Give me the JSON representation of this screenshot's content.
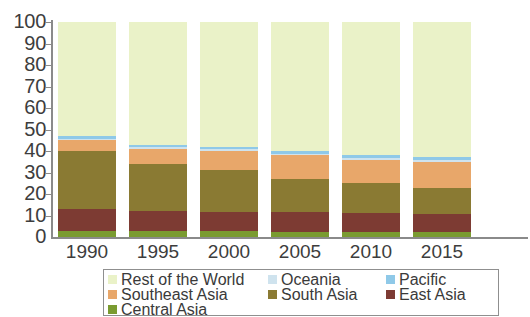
{
  "chart_data": {
    "type": "bar",
    "title": "",
    "subtitle": "",
    "xlabel": "",
    "ylabel": "",
    "stacked": true,
    "stack_total": 100,
    "grid": false,
    "legend_position": "bottom",
    "ylim": [
      0,
      100
    ],
    "ytick_labels": [
      "100",
      "90",
      "80",
      "70",
      "60",
      "50",
      "40",
      "30",
      "20",
      "10",
      "0"
    ],
    "ytick_values": [
      100,
      90,
      80,
      70,
      60,
      50,
      40,
      30,
      20,
      10,
      0
    ],
    "categories": [
      "1990",
      "1995",
      "2000",
      "2005",
      "2010",
      "2015"
    ],
    "series": [
      {
        "name": "Central Asia",
        "color": "#7a9b30",
        "values": [
          3.0,
          2.8,
          2.6,
          2.5,
          2.3,
          2.2
        ]
      },
      {
        "name": "East Asia",
        "color": "#7d3b33",
        "values": [
          10.0,
          9.4,
          9.2,
          9.3,
          8.8,
          8.6
        ]
      },
      {
        "name": "South Asia",
        "color": "#8a7a33",
        "values": [
          27.0,
          21.8,
          19.2,
          15.2,
          13.9,
          12.2
        ]
      },
      {
        "name": "Southeast Asia",
        "color": "#e8a76a",
        "values": [
          5.0,
          7.0,
          9.0,
          11.0,
          11.0,
          12.0
        ]
      },
      {
        "name": "Oceania",
        "color": "#cfe3ee",
        "values": [
          0.8,
          0.8,
          0.8,
          0.8,
          0.8,
          0.8
        ]
      },
      {
        "name": "Pacific",
        "color": "#8fc9e8",
        "values": [
          1.2,
          1.2,
          1.2,
          1.2,
          1.2,
          1.2
        ]
      },
      {
        "name": "Rest of the World",
        "color": "#eaf2c8",
        "values": [
          53.0,
          57.0,
          58.0,
          60.0,
          62.0,
          63.0
        ]
      }
    ]
  },
  "axes": {
    "y_ticks": [
      {
        "label": "100",
        "value": 100
      },
      {
        "label": "90",
        "value": 90
      },
      {
        "label": "80",
        "value": 80
      },
      {
        "label": "70",
        "value": 70
      },
      {
        "label": "60",
        "value": 60
      },
      {
        "label": "50",
        "value": 50
      },
      {
        "label": "40",
        "value": 40
      },
      {
        "label": "30",
        "value": 30
      },
      {
        "label": "20",
        "value": 20
      },
      {
        "label": "10",
        "value": 10
      },
      {
        "label": "0",
        "value": 0
      }
    ],
    "x_ticks": [
      {
        "label": "1990"
      },
      {
        "label": "1995"
      },
      {
        "label": "2000"
      },
      {
        "label": "2005"
      },
      {
        "label": "2010"
      },
      {
        "label": "2015"
      }
    ]
  },
  "legend": {
    "rows": [
      [
        {
          "label": "Rest of the World",
          "color": "#eaf2c8"
        },
        {
          "label": "Oceania",
          "color": "#cfe3ee"
        },
        {
          "label": "Pacific",
          "color": "#8fc9e8"
        }
      ],
      [
        {
          "label": "Southeast Asia",
          "color": "#e8a76a"
        },
        {
          "label": "South Asia",
          "color": "#8a7a33"
        },
        {
          "label": "East Asia",
          "color": "#7d3b33"
        }
      ],
      [
        {
          "label": "Central Asia",
          "color": "#7a9b30"
        }
      ]
    ]
  }
}
